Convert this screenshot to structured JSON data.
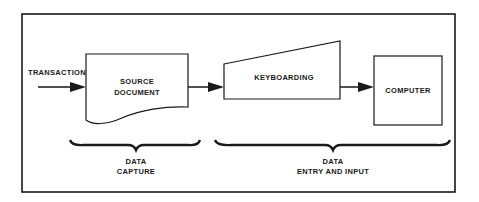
{
  "diagram": {
    "input_label": "TRANSACTION",
    "nodes": [
      {
        "id": "source-document",
        "shape": "document",
        "lines": [
          "SOURCE",
          "DOCUMENT"
        ]
      },
      {
        "id": "keyboarding",
        "shape": "manual-input",
        "lines": [
          "KEYBOARDING"
        ]
      },
      {
        "id": "computer",
        "shape": "rectangle",
        "lines": [
          "COMPUTER"
        ]
      }
    ],
    "edges": [
      {
        "from": "TRANSACTION",
        "to": "source-document"
      },
      {
        "from": "source-document",
        "to": "keyboarding"
      },
      {
        "from": "keyboarding",
        "to": "computer"
      }
    ],
    "groups": [
      {
        "id": "data-capture",
        "lines": [
          "DATA",
          "CAPTURE"
        ],
        "spans": [
          "source-document"
        ]
      },
      {
        "id": "data-entry-input",
        "lines": [
          "DATA",
          "ENTRY AND INPUT"
        ],
        "spans": [
          "keyboarding",
          "computer"
        ]
      }
    ],
    "colors": {
      "stroke": "#1a1a1a",
      "background": "#ffffff"
    }
  }
}
